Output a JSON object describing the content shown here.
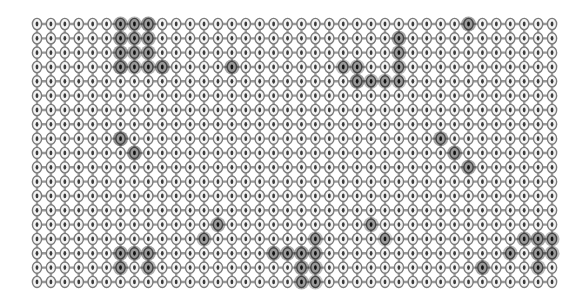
{
  "diagram": {
    "type": "grid-lattice",
    "columns": 38,
    "rows": 19,
    "origin": {
      "x": 37,
      "y": 24
    },
    "spacing": {
      "dx": 13.92,
      "dy": 14.33
    },
    "node": {
      "rx": 4.6,
      "ry": 5.6,
      "stroke": "#7a7a7a",
      "fill": "#f4f4f4",
      "core": "#3a3a3a"
    },
    "edge": {
      "stroke": "#9a9a9a",
      "width": 2.4
    },
    "highlight_color": "#2e2e2e",
    "highlighted_nodes": [
      {
        "c": 6,
        "r": 0,
        "v": 0.7
      },
      {
        "c": 6,
        "r": 1,
        "v": 0.8
      },
      {
        "c": 6,
        "r": 2,
        "v": 0.8
      },
      {
        "c": 6,
        "r": 3,
        "v": 1.0
      },
      {
        "c": 7,
        "r": 0,
        "v": 0.6
      },
      {
        "c": 7,
        "r": 1,
        "v": 0.6
      },
      {
        "c": 7,
        "r": 2,
        "v": 0.6
      },
      {
        "c": 7,
        "r": 3,
        "v": 0.5
      },
      {
        "c": 8,
        "r": 0,
        "v": 0.9
      },
      {
        "c": 8,
        "r": 1,
        "v": 0.7
      },
      {
        "c": 8,
        "r": 2,
        "v": 0.7
      },
      {
        "c": 8,
        "r": 3,
        "v": 0.6
      },
      {
        "c": 9,
        "r": 3,
        "v": 0.9
      },
      {
        "c": 14,
        "r": 3,
        "v": 0.8
      },
      {
        "c": 22,
        "r": 3,
        "v": 0.5
      },
      {
        "c": 23,
        "r": 3,
        "v": 0.6
      },
      {
        "c": 23,
        "r": 4,
        "v": 0.9
      },
      {
        "c": 24,
        "r": 4,
        "v": 0.6
      },
      {
        "c": 25,
        "r": 4,
        "v": 0.5
      },
      {
        "c": 26,
        "r": 1,
        "v": 0.8
      },
      {
        "c": 26,
        "r": 2,
        "v": 0.7
      },
      {
        "c": 26,
        "r": 3,
        "v": 0.6
      },
      {
        "c": 26,
        "r": 4,
        "v": 0.5
      },
      {
        "c": 31,
        "r": 0,
        "v": 0.8
      },
      {
        "c": 6,
        "r": 8,
        "v": 1.0
      },
      {
        "c": 7,
        "r": 9,
        "v": 0.9
      },
      {
        "c": 29,
        "r": 8,
        "v": 0.8
      },
      {
        "c": 30,
        "r": 9,
        "v": 0.8
      },
      {
        "c": 31,
        "r": 10,
        "v": 0.8
      },
      {
        "c": 13,
        "r": 14,
        "v": 0.7
      },
      {
        "c": 12,
        "r": 15,
        "v": 0.6
      },
      {
        "c": 24,
        "r": 14,
        "v": 0.6
      },
      {
        "c": 25,
        "r": 15,
        "v": 0.4
      },
      {
        "c": 20,
        "r": 15,
        "v": 0.6
      },
      {
        "c": 6,
        "r": 16,
        "v": 0.8
      },
      {
        "c": 7,
        "r": 16,
        "v": 0.7
      },
      {
        "c": 8,
        "r": 16,
        "v": 0.8
      },
      {
        "c": 6,
        "r": 17,
        "v": 0.7
      },
      {
        "c": 8,
        "r": 17,
        "v": 0.7
      },
      {
        "c": 17,
        "r": 16,
        "v": 0.7
      },
      {
        "c": 18,
        "r": 16,
        "v": 0.7
      },
      {
        "c": 19,
        "r": 16,
        "v": 0.8
      },
      {
        "c": 19,
        "r": 17,
        "v": 0.8
      },
      {
        "c": 19,
        "r": 18,
        "v": 0.7
      },
      {
        "c": 20,
        "r": 16,
        "v": 0.7
      },
      {
        "c": 20,
        "r": 17,
        "v": 0.6
      },
      {
        "c": 20,
        "r": 18,
        "v": 0.5
      },
      {
        "c": 32,
        "r": 17,
        "v": 0.8
      },
      {
        "c": 34,
        "r": 16,
        "v": 0.6
      },
      {
        "c": 35,
        "r": 15,
        "v": 0.7
      },
      {
        "c": 36,
        "r": 15,
        "v": 0.8
      },
      {
        "c": 36,
        "r": 16,
        "v": 0.8
      },
      {
        "c": 36,
        "r": 17,
        "v": 0.6
      },
      {
        "c": 37,
        "r": 15,
        "v": 0.6
      },
      {
        "c": 37,
        "r": 16,
        "v": 0.6
      }
    ]
  }
}
